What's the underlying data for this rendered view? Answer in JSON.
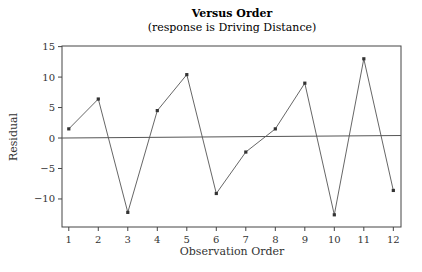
{
  "chart_data": {
    "type": "line",
    "title": "Versus Order",
    "subtitle": "(response is Driving Distance)",
    "xlabel": "Observation Order",
    "ylabel": "Residual",
    "x": [
      1,
      2,
      3,
      4,
      5,
      6,
      7,
      8,
      9,
      10,
      11,
      12
    ],
    "series": [
      {
        "name": "Residual",
        "values": [
          1.5,
          6.4,
          -12.2,
          4.5,
          10.4,
          -9.1,
          -2.3,
          1.5,
          9.0,
          -12.6,
          13.0,
          -8.6
        ]
      }
    ],
    "yticks": [
      15,
      10,
      5,
      0,
      -5,
      -10
    ],
    "ytick_labels": [
      "15",
      "10",
      "5",
      "0",
      "−5",
      "−10"
    ],
    "xticks": [
      1,
      2,
      3,
      4,
      5,
      6,
      7,
      8,
      9,
      10,
      11,
      12
    ],
    "ylim": [
      -14.6,
      15.1
    ],
    "xlim": [
      0.77,
      12.26
    ],
    "reference_line": {
      "y": 0
    },
    "grid": false,
    "legend": null
  },
  "colors": {
    "line": "#555555",
    "marker": "#333333",
    "frame": "#444444",
    "reference": "#555555"
  }
}
